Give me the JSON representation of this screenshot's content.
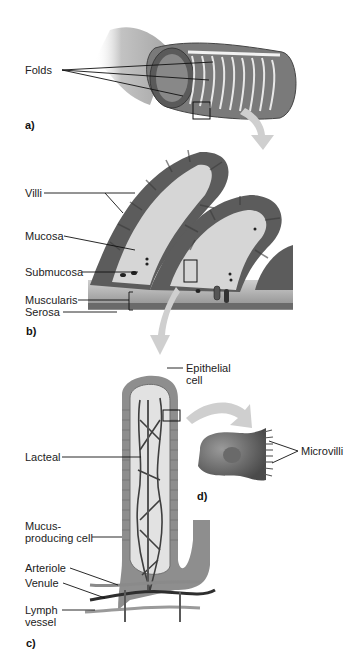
{
  "diagram": {
    "title_fragment": "",
    "panels": {
      "a": {
        "label": "a)",
        "callouts": {
          "folds": "Folds"
        }
      },
      "b": {
        "label": "b)",
        "callouts": {
          "villi": "Villi",
          "mucosa": "Mucosa",
          "submucosa": "Submucosa",
          "muscularis": "Muscularis",
          "serosa": "Serosa"
        }
      },
      "c": {
        "label": "c)",
        "callouts": {
          "epithelial_line1": "Epithelial",
          "epithelial_line2": "cell",
          "lacteal": "Lacteal",
          "mucus_line1": "Mucus-",
          "mucus_line2": "producing cell",
          "arteriole": "Arteriole",
          "venule": "Venule",
          "lymph_line1": "Lymph",
          "lymph_line2": "vessel"
        }
      },
      "d": {
        "label": "d)",
        "callouts": {
          "microvilli": "Microvilli"
        }
      }
    },
    "colors": {
      "tissue_dark": "#5a5a5a",
      "tissue_mid": "#8a8a8a",
      "tissue_light": "#d4d4d4",
      "arrow": "#cfcfcf",
      "line": "#111111"
    }
  }
}
